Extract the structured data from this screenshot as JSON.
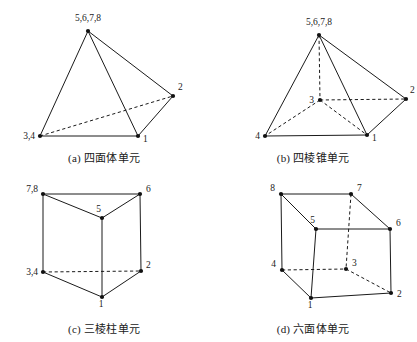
{
  "figure": {
    "panels": [
      {
        "id": "tetrahedron",
        "tag": "(a)",
        "caption": "四面体单元",
        "nodes": [
          {
            "label": "5,6,7,8",
            "x": 88,
            "y": 31,
            "lx": 88,
            "ly": 21,
            "anchor": "middle"
          },
          {
            "label": "2",
            "x": 173,
            "y": 96,
            "lx": 178,
            "ly": 90,
            "anchor": "start"
          },
          {
            "label": "3,4",
            "x": 40,
            "y": 136,
            "lx": 35,
            "ly": 139,
            "anchor": "end"
          },
          {
            "label": "1",
            "x": 138,
            "y": 136,
            "lx": 143,
            "ly": 142,
            "anchor": "start"
          }
        ],
        "solid_edges": [
          [
            88,
            31,
            40,
            136
          ],
          [
            88,
            31,
            138,
            136
          ],
          [
            88,
            31,
            173,
            96
          ],
          [
            40,
            136,
            138,
            136
          ],
          [
            138,
            136,
            173,
            96
          ]
        ],
        "dashed_edges": [
          [
            40,
            136,
            173,
            96
          ]
        ]
      },
      {
        "id": "pyramid",
        "tag": "(b)",
        "caption": "四棱锥单元",
        "nodes": [
          {
            "label": "5,6,7,8",
            "x": 110,
            "y": 35,
            "lx": 110,
            "ly": 25,
            "anchor": "middle"
          },
          {
            "label": "2",
            "x": 197,
            "y": 99,
            "lx": 201,
            "ly": 93,
            "anchor": "start"
          },
          {
            "label": "3",
            "x": 111,
            "y": 100,
            "lx": 105,
            "ly": 103,
            "anchor": "end"
          },
          {
            "label": "4",
            "x": 56,
            "y": 136,
            "lx": 51,
            "ly": 139,
            "anchor": "end"
          },
          {
            "label": "1",
            "x": 158,
            "y": 135,
            "lx": 163,
            "ly": 141,
            "anchor": "start"
          }
        ],
        "solid_edges": [
          [
            110,
            35,
            56,
            136
          ],
          [
            110,
            35,
            158,
            135
          ],
          [
            110,
            35,
            197,
            99
          ],
          [
            56,
            136,
            158,
            135
          ],
          [
            158,
            135,
            197,
            99
          ]
        ],
        "dashed_edges": [
          [
            110,
            35,
            111,
            100
          ],
          [
            111,
            100,
            197,
            99
          ],
          [
            111,
            100,
            56,
            136
          ],
          [
            111,
            100,
            158,
            135
          ]
        ]
      },
      {
        "id": "prism",
        "tag": "(c)",
        "caption": "三棱柱单元",
        "nodes": [
          {
            "label": "7,8",
            "x": 43,
            "y": 23,
            "lx": 38,
            "ly": 21,
            "anchor": "end"
          },
          {
            "label": "6",
            "x": 140,
            "y": 23,
            "lx": 146,
            "ly": 21,
            "anchor": "start"
          },
          {
            "label": "5",
            "x": 102,
            "y": 47,
            "lx": 101,
            "ly": 41,
            "anchor": "end"
          },
          {
            "label": "3,4",
            "x": 43,
            "y": 101,
            "lx": 38,
            "ly": 104,
            "anchor": "end"
          },
          {
            "label": "2",
            "x": 141,
            "y": 100,
            "lx": 146,
            "ly": 97,
            "anchor": "start"
          },
          {
            "label": "1",
            "x": 102,
            "y": 126,
            "lx": 101,
            "ly": 136,
            "anchor": "middle"
          }
        ],
        "solid_edges": [
          [
            43,
            23,
            140,
            23
          ],
          [
            43,
            23,
            102,
            47
          ],
          [
            140,
            23,
            102,
            47
          ],
          [
            43,
            23,
            43,
            101
          ],
          [
            140,
            23,
            141,
            100
          ],
          [
            102,
            47,
            102,
            126
          ],
          [
            43,
            101,
            102,
            126
          ],
          [
            141,
            100,
            102,
            126
          ]
        ],
        "dashed_edges": [
          [
            43,
            101,
            141,
            100
          ]
        ]
      },
      {
        "id": "hexahedron",
        "tag": "(d)",
        "caption": "六面体单元",
        "nodes": [
          {
            "label": "8",
            "x": 72,
            "y": 23,
            "lx": 66,
            "ly": 20,
            "anchor": "end"
          },
          {
            "label": "7",
            "x": 142,
            "y": 23,
            "lx": 148,
            "ly": 20,
            "anchor": "start"
          },
          {
            "label": "5",
            "x": 107,
            "y": 58,
            "lx": 106,
            "ly": 52,
            "anchor": "end"
          },
          {
            "label": "6",
            "x": 181,
            "y": 58,
            "lx": 187,
            "ly": 55,
            "anchor": "start"
          },
          {
            "label": "4",
            "x": 73,
            "y": 99,
            "lx": 67,
            "ly": 96,
            "anchor": "end"
          },
          {
            "label": "3",
            "x": 137,
            "y": 98,
            "lx": 143,
            "ly": 95,
            "anchor": "start"
          },
          {
            "label": "1",
            "x": 102,
            "y": 127,
            "lx": 101,
            "ly": 137,
            "anchor": "middle"
          },
          {
            "label": "2",
            "x": 182,
            "y": 122,
            "lx": 188,
            "ly": 126,
            "anchor": "start"
          }
        ],
        "solid_edges": [
          [
            72,
            23,
            142,
            23
          ],
          [
            72,
            23,
            107,
            58
          ],
          [
            142,
            23,
            181,
            58
          ],
          [
            107,
            58,
            181,
            58
          ],
          [
            72,
            23,
            73,
            99
          ],
          [
            107,
            58,
            102,
            127
          ],
          [
            181,
            58,
            182,
            122
          ],
          [
            73,
            99,
            102,
            127
          ],
          [
            102,
            127,
            182,
            122
          ]
        ],
        "dashed_edges": [
          [
            142,
            23,
            137,
            98
          ],
          [
            73,
            99,
            137,
            98
          ],
          [
            137,
            98,
            182,
            122
          ]
        ]
      }
    ]
  },
  "style": {
    "line_color": "#1a1a1a",
    "node_color": "#111111",
    "background": "#ffffff"
  }
}
